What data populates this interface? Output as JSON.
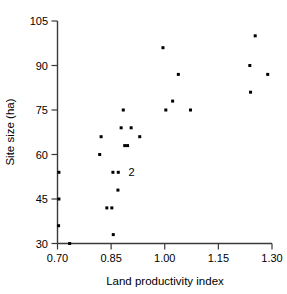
{
  "chart_data": {
    "type": "scatter",
    "title": "",
    "subtitle": "",
    "xlabel": "Land productivity index",
    "ylabel": "Site size (ha)",
    "xlim": [
      0.7,
      1.3
    ],
    "ylim": [
      30,
      105
    ],
    "xticks": [
      0.7,
      0.85,
      1.0,
      1.15,
      1.3
    ],
    "xtick_labels": [
      "0.70",
      "0.85",
      "1.00",
      "1.15",
      "1.30"
    ],
    "yticks": [
      30,
      45,
      60,
      75,
      90,
      105
    ],
    "ytick_labels": [
      "30",
      "45",
      "60",
      "75",
      "90",
      "105"
    ],
    "grid": false,
    "legend": null,
    "marker": "square-dot",
    "marker_color": "#000000",
    "points": [
      {
        "x": 0.704,
        "y": 54
      },
      {
        "x": 0.704,
        "y": 45
      },
      {
        "x": 0.703,
        "y": 36
      },
      {
        "x": 0.734,
        "y": 30
      },
      {
        "x": 0.818,
        "y": 60
      },
      {
        "x": 0.822,
        "y": 66
      },
      {
        "x": 0.838,
        "y": 42
      },
      {
        "x": 0.852,
        "y": 42
      },
      {
        "x": 0.855,
        "y": 54
      },
      {
        "x": 0.856,
        "y": 33
      },
      {
        "x": 0.87,
        "y": 54
      },
      {
        "x": 0.869,
        "y": 48
      },
      {
        "x": 0.878,
        "y": 69
      },
      {
        "x": 0.884,
        "y": 75
      },
      {
        "x": 0.888,
        "y": 63
      },
      {
        "x": 0.896,
        "y": 63
      },
      {
        "x": 0.906,
        "y": 69
      },
      {
        "x": 0.93,
        "y": 66
      },
      {
        "x": 0.995,
        "y": 96
      },
      {
        "x": 1.003,
        "y": 75
      },
      {
        "x": 1.022,
        "y": 78
      },
      {
        "x": 1.038,
        "y": 87
      },
      {
        "x": 1.072,
        "y": 75
      },
      {
        "x": 1.238,
        "y": 90
      },
      {
        "x": 1.24,
        "y": 81
      },
      {
        "x": 1.253,
        "y": 100
      },
      {
        "x": 1.288,
        "y": 87
      }
    ],
    "annotations": [
      {
        "text": "2",
        "x": 0.882,
        "y": 54,
        "note": "two coincident observations"
      }
    ]
  },
  "axes": {
    "x_axis_name": "land-productivity-index-axis",
    "y_axis_name": "site-size-axis"
  }
}
